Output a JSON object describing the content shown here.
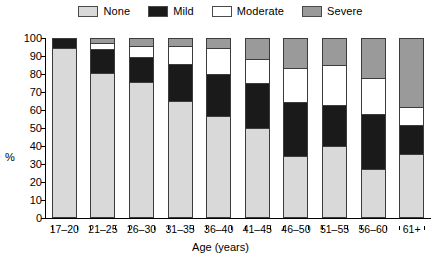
{
  "legend": {
    "position": "top-center",
    "entries": [
      {
        "label": "None",
        "color": "#d9d9d9"
      },
      {
        "label": "Mild",
        "color": "#1a1a1a"
      },
      {
        "label": "Moderate",
        "color": "#ffffff"
      },
      {
        "label": "Severe",
        "color": "#9a9a9a"
      }
    ]
  },
  "axes": {
    "y_title": "%",
    "x_title": "Age (years)",
    "y_ticks": [
      0,
      10,
      20,
      30,
      40,
      50,
      60,
      70,
      80,
      90,
      100
    ]
  },
  "chart_data": {
    "type": "bar",
    "subtype": "stacked-bar-100",
    "title": "",
    "xlabel": "Age (years)",
    "ylabel": "%",
    "ylim": [
      0,
      100
    ],
    "ytick_step": 10,
    "grid": false,
    "legend_position": "top-center",
    "categories": [
      "17–20",
      "21–25",
      "26–30",
      "31–35",
      "36–40",
      "41–45",
      "46–50",
      "51–55",
      "56–60",
      "61+"
    ],
    "series": [
      {
        "name": "None",
        "color": "#d9d9d9",
        "values": [
          95.0,
          81.0,
          76.0,
          65.0,
          57.0,
          50.0,
          34.5,
          40.0,
          27.0,
          35.5
        ]
      },
      {
        "name": "Mild",
        "color": "#1a1a1a",
        "values": [
          5.0,
          13.5,
          14.0,
          21.0,
          23.5,
          25.0,
          30.0,
          23.0,
          31.0,
          16.0
        ]
      },
      {
        "name": "Moderate",
        "color": "#ffffff",
        "values": [
          0.0,
          3.5,
          6.0,
          10.0,
          14.5,
          13.5,
          19.0,
          22.5,
          20.0,
          10.5
        ]
      },
      {
        "name": "Severe",
        "color": "#9a9a9a",
        "values": [
          0.0,
          2.0,
          4.0,
          4.0,
          5.0,
          11.5,
          16.5,
          14.5,
          22.0,
          38.0
        ]
      }
    ]
  }
}
